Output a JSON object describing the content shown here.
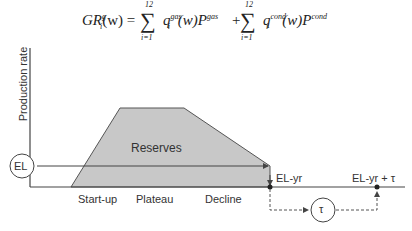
{
  "formula": {
    "lhs": "GR",
    "lhs_sup": "g",
    "lhs_sub": "i",
    "lhs_arg": "(w) =",
    "sum1_upper": "12",
    "sum1_lower": "i=1",
    "term1": "q",
    "term1_sup": "gas",
    "term1_sub": "i",
    "term1_rest": "(w)P",
    "term1_price_sup": "gas",
    "plus": "+",
    "sum2_upper": "12",
    "sum2_lower": "i=1",
    "term2": "q",
    "term2_sup": "cond",
    "term2_sub": "i",
    "term2_rest": "(w)P",
    "term2_price_sup": "cond"
  },
  "diagram": {
    "y_axis_label": "Production rate",
    "area_label": "Reserves",
    "el_circle_label": "EL",
    "tau_circle_label": "τ",
    "phases": [
      "Start-up",
      "Plateau",
      "Decline"
    ],
    "el_yr_label": "EL-yr",
    "el_yr_tau_label": "EL-yr + τ",
    "fill_color": "#c8c8c8",
    "line_color": "#444444"
  }
}
